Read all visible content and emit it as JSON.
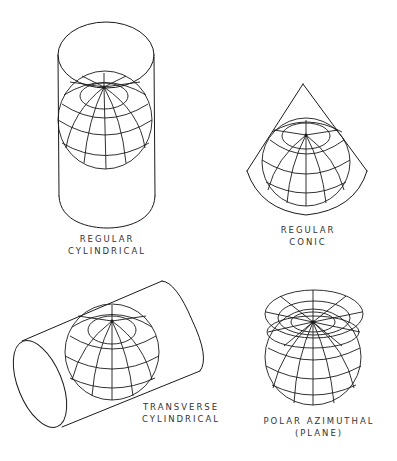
{
  "diagram": {
    "ink_color": "#1a1a1a",
    "background": "#ffffff",
    "panels": [
      {
        "id": "regular-cylindrical",
        "label_lines": [
          "REGULAR",
          "CYLINDRICAL"
        ],
        "label_pos": {
          "x": 107,
          "y": 233
        },
        "surface": "cylinder-vertical",
        "globe": {
          "cx": 105,
          "cy": 120,
          "r": 48,
          "pole": {
            "x": 104,
            "y": 87
          }
        }
      },
      {
        "id": "regular-conic",
        "label_lines": [
          "REGULAR",
          "CONIC"
        ],
        "label_pos": {
          "x": 308,
          "y": 224
        },
        "surface": "cone",
        "globe": {
          "cx": 306,
          "cy": 162,
          "r": 44,
          "pole": {
            "x": 306,
            "y": 135
          }
        },
        "apex": {
          "x": 303,
          "y": 84
        }
      },
      {
        "id": "transverse-cylindrical",
        "label_lines": [
          "TRANSVERSE",
          "CYLINDRICAL"
        ],
        "label_pos": {
          "x": 181,
          "y": 401
        },
        "surface": "cylinder-transverse",
        "globe": {
          "cx": 112,
          "cy": 352,
          "r": 48,
          "pole": {
            "x": 112,
            "y": 321
          }
        }
      },
      {
        "id": "polar-azimuthal",
        "label_lines": [
          "POLAR AZIMUTHAL",
          "(PLANE)"
        ],
        "label_pos": {
          "x": 319,
          "y": 415
        },
        "surface": "plane",
        "globe": {
          "cx": 313,
          "cy": 357,
          "r": 48,
          "pole": {
            "x": 313,
            "y": 322
          }
        }
      }
    ]
  }
}
